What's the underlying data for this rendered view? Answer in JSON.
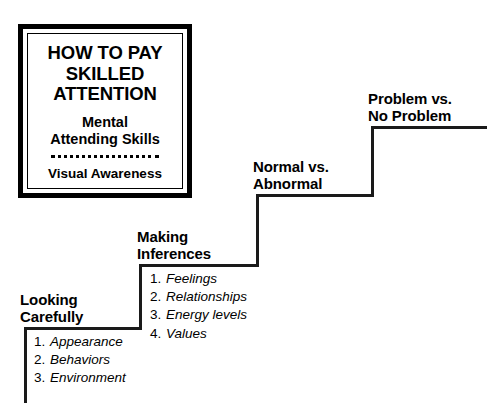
{
  "diagram": {
    "title_plaque": {
      "heading": "HOW TO PAY\nSKILLED\nATTENTION",
      "subheading": "Mental\nAttending Skills",
      "divider": "dotted-divider",
      "footer": "Visual Awareness"
    },
    "steps": [
      {
        "id": "looking-carefully",
        "label": "Looking\nCarefully",
        "items": [
          {
            "num": "1.",
            "text": "Appearance"
          },
          {
            "num": "2.",
            "text": "Behaviors"
          },
          {
            "num": "3.",
            "text": "Environment"
          }
        ]
      },
      {
        "id": "making-inferences",
        "label": "Making\nInferences",
        "items": [
          {
            "num": "1.",
            "text": "Feelings"
          },
          {
            "num": "2.",
            "text": "Relationships"
          },
          {
            "num": "3.",
            "text": "Energy levels"
          },
          {
            "num": "4.",
            "text": "Values"
          }
        ]
      },
      {
        "id": "normal-vs-abnormal",
        "label": "Normal vs.\nAbnormal",
        "items": []
      },
      {
        "id": "problem-vs-no-problem",
        "label": "Problem vs.\nNo Problem",
        "items": []
      }
    ],
    "colors": {
      "ink": "#1a1a1a",
      "background": "#ffffff",
      "plaque_border": "#000000"
    }
  }
}
